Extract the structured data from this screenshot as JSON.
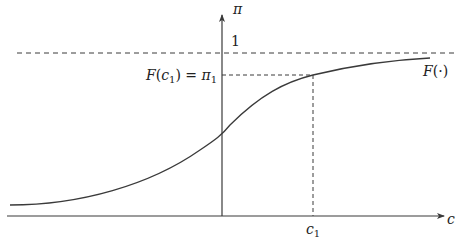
{
  "diagram": {
    "type": "cdf-curve",
    "axes": {
      "x_label": "c",
      "y_label": "π"
    },
    "asymptote": {
      "label": "1",
      "style": "dashed"
    },
    "curve": {
      "label": "F(·)",
      "label_fn": "F",
      "label_arg": "(·)"
    },
    "marked_point": {
      "x_label_base": "c",
      "x_label_sub": "1",
      "y_label_fn": "F",
      "y_label_open": "(",
      "y_label_arg": "c",
      "y_label_arg_sub": "1",
      "y_label_close": ") = ",
      "y_label_val": "π",
      "y_label_val_sub": "1",
      "guides_style": "dashed"
    },
    "colors": {
      "line": "#3a3a3a",
      "text": "#222222",
      "background": "#ffffff"
    }
  }
}
